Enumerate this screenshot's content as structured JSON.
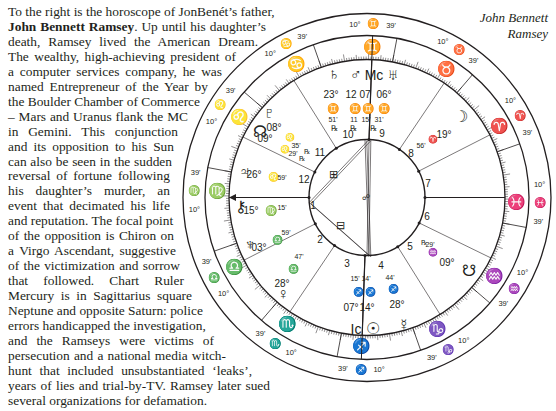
{
  "caption": {
    "line1": "John Bennett",
    "line2": "Ramsey"
  },
  "article": {
    "lines": [
      {
        "pre": "To the right is the horoscope of JonBenét’s father,",
        "bold": "",
        "post": "",
        "w": 263
      },
      {
        "pre": "",
        "bold": "John Bennett Ramsey",
        "post": ". Up until his daughter’s",
        "w": 258
      },
      {
        "pre": "death, Ramsey lived the American Dream.",
        "bold": "",
        "post": "",
        "w": 250
      },
      {
        "pre": "The wealthy, high-achieving president of",
        "bold": "",
        "post": "",
        "w": 228
      },
      {
        "pre": "a computer services company, he was",
        "bold": "",
        "post": "",
        "w": 214
      },
      {
        "pre": "named Entrepreneur of the Year by",
        "bold": "",
        "post": "",
        "w": 200
      },
      {
        "pre": "the Boulder Chamber of Commerce",
        "bold": "",
        "post": "",
        "w": 192
      },
      {
        "pre": "– Mars and Uranus flank the MC",
        "bold": "",
        "post": "",
        "w": 180
      },
      {
        "pre": "in Gemini. This conjunction",
        "bold": "",
        "post": "",
        "w": 170
      },
      {
        "pre": "and its opposition to his Sun",
        "bold": "",
        "post": "",
        "w": 166
      },
      {
        "pre": "can also be seen in the sudden",
        "bold": "",
        "post": "",
        "w": 164
      },
      {
        "pre": "reversal of fortune following",
        "bold": "",
        "post": "",
        "w": 162
      },
      {
        "pre": "his daughter’s murder, an",
        "bold": "",
        "post": "",
        "w": 162
      },
      {
        "pre": "event that decimated his life",
        "bold": "",
        "post": "",
        "w": 162
      },
      {
        "pre": "and reputation. The focal point",
        "bold": "",
        "post": "",
        "w": 164
      },
      {
        "pre": "of the opposition is Chiron on",
        "bold": "",
        "post": "",
        "w": 166
      },
      {
        "pre": "a Virgo Ascendant, suggestive",
        "bold": "",
        "post": "",
        "w": 168
      },
      {
        "pre": "of the victimization and sorrow",
        "bold": "",
        "post": "",
        "w": 172
      },
      {
        "pre": "that followed. Chart Ruler",
        "bold": "",
        "post": "",
        "w": 176
      },
      {
        "pre": "Mercury is in Sagittarius square",
        "bold": "",
        "post": "",
        "w": 184
      },
      {
        "pre": "Neptune and opposite Saturn: police",
        "bold": "",
        "post": "",
        "w": 190
      },
      {
        "pre": "errors handicapped the investigation,",
        "bold": "",
        "post": "",
        "w": 196
      },
      {
        "pre": "and the Ramseys were victims of",
        "bold": "",
        "post": "",
        "w": 206
      },
      {
        "pre": "persecution and a national media witch-",
        "bold": "",
        "post": "",
        "w": 218
      },
      {
        "pre": "hunt that included unsubstantiated ‘leaks’,",
        "bold": "",
        "post": "",
        "w": 244
      },
      {
        "pre": "years of lies and trial-by-TV. Ramsey later sued",
        "bold": "",
        "post": "",
        "w": 262
      },
      {
        "pre": "several organizations for defamation.",
        "bold": "",
        "post": "",
        "w": 0
      }
    ]
  },
  "chart": {
    "center": [
      367,
      197.5
    ],
    "radii": {
      "outer": 184,
      "sign_outer": 162,
      "sign_inner": 138,
      "house": 58
    },
    "cusp_degree": "10°",
    "cusp_minute": "39'",
    "signs_outer": [
      {
        "glyph": "♊",
        "x": 364,
        "y": 24
      },
      {
        "glyph": "♉",
        "x": 446,
        "y": 46
      },
      {
        "glyph": "♈",
        "x": 510,
        "y": 110
      },
      {
        "glyph": "♓",
        "x": 531,
        "y": 197
      },
      {
        "glyph": "♒",
        "x": 510,
        "y": 283
      },
      {
        "glyph": "♑",
        "x": 447,
        "y": 348
      },
      {
        "glyph": "♐",
        "x": 366,
        "y": 370
      },
      {
        "glyph": "♏",
        "x": 284,
        "y": 348
      },
      {
        "glyph": "♎",
        "x": 219,
        "y": 285
      },
      {
        "glyph": "♍",
        "x": 201,
        "y": 197
      },
      {
        "glyph": "♌",
        "x": 222,
        "y": 108
      },
      {
        "glyph": "♋",
        "x": 285,
        "y": 46
      }
    ],
    "signs_band": [
      {
        "glyph": "♊",
        "x": 367,
        "y": 52
      },
      {
        "glyph": "♉",
        "x": 431,
        "y": 66
      },
      {
        "glyph": "♈",
        "x": 484,
        "y": 112
      },
      {
        "glyph": "♓",
        "x": 510,
        "y": 188
      },
      {
        "glyph": "♒",
        "x": 498,
        "y": 262
      },
      {
        "glyph": "♑",
        "x": 449,
        "y": 328
      },
      {
        "glyph": "♐",
        "x": 374,
        "y": 350
      },
      {
        "glyph": "♏",
        "x": 301,
        "y": 338
      },
      {
        "glyph": "♎",
        "x": 244,
        "y": 290
      },
      {
        "glyph": "♍",
        "x": 217,
        "y": 210
      },
      {
        "glyph": "♌",
        "x": 229,
        "y": 140
      },
      {
        "glyph": "♋",
        "x": 279,
        "y": 80
      }
    ],
    "planets": [
      {
        "name": "Saturn",
        "glyph": "♄",
        "x": 334,
        "y": 75
      },
      {
        "name": "Mars",
        "glyph": "♂",
        "x": 356,
        "y": 76
      },
      {
        "name": "MC",
        "glyph": "Mc",
        "x": 374,
        "y": 76
      },
      {
        "name": "Uranus",
        "glyph": "♅",
        "x": 393,
        "y": 76
      },
      {
        "name": "Pluto",
        "glyph": "♇",
        "x": 269,
        "y": 114
      },
      {
        "name": "North Node",
        "glyph": "☊",
        "x": 260,
        "y": 133
      },
      {
        "name": "Jupiter",
        "glyph": "♃",
        "x": 245,
        "y": 173
      },
      {
        "name": "Chiron",
        "glyph": "⚷",
        "x": 241,
        "y": 208
      },
      {
        "name": "Neptune",
        "glyph": "♆",
        "x": 250,
        "y": 246
      },
      {
        "name": "Venus",
        "glyph": "♀",
        "x": 283,
        "y": 295
      },
      {
        "name": "IC",
        "glyph": "Ic",
        "x": 356,
        "y": 330
      },
      {
        "name": "Sun",
        "glyph": "☉",
        "x": 373,
        "y": 330
      },
      {
        "name": "Mercury",
        "glyph": "☿",
        "x": 404,
        "y": 326
      },
      {
        "name": "South Node",
        "glyph": "☋",
        "x": 469,
        "y": 272
      },
      {
        "name": "Moon",
        "glyph": "☽",
        "x": 461,
        "y": 118
      }
    ],
    "labels": [
      {
        "t": "23°",
        "x": 331,
        "y": 95,
        "s": 10
      },
      {
        "t": "12",
        "x": 351,
        "y": 95,
        "s": 10
      },
      {
        "t": "07",
        "x": 365,
        "y": 95,
        "s": 10
      },
      {
        "t": "06°",
        "x": 384,
        "y": 95,
        "s": 10
      },
      {
        "t": "♊",
        "x": 333,
        "y": 109,
        "s": 10
      },
      {
        "t": "♊",
        "x": 355,
        "y": 109,
        "s": 10
      },
      {
        "t": "♊",
        "x": 368,
        "y": 109,
        "s": 10
      },
      {
        "t": "♊",
        "x": 384,
        "y": 109,
        "s": 10
      },
      {
        "t": "51'",
        "x": 333,
        "y": 120,
        "s": 7
      },
      {
        "t": "11",
        "x": 354,
        "y": 120,
        "s": 7
      },
      {
        "t": "15'",
        "x": 366,
        "y": 120,
        "s": 7
      },
      {
        "t": "31'",
        "x": 379,
        "y": 120,
        "s": 7
      },
      {
        "t": "℞",
        "x": 334,
        "y": 129,
        "s": 8
      },
      {
        "t": "℞",
        "x": 353,
        "y": 129,
        "s": 8
      },
      {
        "t": "℞",
        "x": 373,
        "y": 129,
        "s": 8
      },
      {
        "t": "08°",
        "x": 274,
        "y": 128,
        "s": 10
      },
      {
        "t": "09°",
        "x": 265,
        "y": 139,
        "s": 10
      },
      {
        "t": "♌",
        "x": 290,
        "y": 138,
        "s": 8
      },
      {
        "t": "35'",
        "x": 296,
        "y": 146,
        "s": 7
      },
      {
        "t": "♌",
        "x": 285,
        "y": 150,
        "s": 8
      },
      {
        "t": "29'",
        "x": 293,
        "y": 154,
        "s": 7
      },
      {
        "t": "℞",
        "x": 307,
        "y": 152,
        "s": 7
      },
      {
        "t": "℞",
        "x": 302,
        "y": 159,
        "s": 7
      },
      {
        "t": "26°",
        "x": 254,
        "y": 175,
        "s": 10
      },
      {
        "t": "♌",
        "x": 273,
        "y": 178,
        "s": 9
      },
      {
        "t": "59'",
        "x": 282,
        "y": 178,
        "s": 7
      },
      {
        "t": "15°",
        "x": 251,
        "y": 211,
        "s": 10
      },
      {
        "t": "♍",
        "x": 271,
        "y": 211,
        "s": 10
      },
      {
        "t": "15'",
        "x": 282,
        "y": 208,
        "s": 7
      },
      {
        "t": "03°",
        "x": 259,
        "y": 248,
        "s": 10
      },
      {
        "t": "♎",
        "x": 277,
        "y": 241,
        "s": 9
      },
      {
        "t": "59'",
        "x": 286,
        "y": 233,
        "s": 7
      },
      {
        "t": "47'",
        "x": 299,
        "y": 257,
        "s": 7
      },
      {
        "t": "♎",
        "x": 293,
        "y": 270,
        "s": 9
      },
      {
        "t": "28°",
        "x": 282,
        "y": 284,
        "s": 10
      },
      {
        "t": "15'",
        "x": 355,
        "y": 279,
        "s": 7
      },
      {
        "t": "14'",
        "x": 366,
        "y": 279,
        "s": 7
      },
      {
        "t": "♐",
        "x": 358,
        "y": 293,
        "s": 9
      },
      {
        "t": "♐",
        "x": 370,
        "y": 293,
        "s": 9
      },
      {
        "t": "07°",
        "x": 351,
        "y": 308,
        "s": 10
      },
      {
        "t": "14°",
        "x": 367,
        "y": 308,
        "s": 10
      },
      {
        "t": "44'",
        "x": 390,
        "y": 278,
        "s": 7
      },
      {
        "t": "♐",
        "x": 393,
        "y": 290,
        "s": 9
      },
      {
        "t": "28°",
        "x": 397,
        "y": 305,
        "s": 10
      },
      {
        "t": "℞",
        "x": 424,
        "y": 243,
        "s": 7
      },
      {
        "t": "29'",
        "x": 430,
        "y": 245,
        "s": 7
      },
      {
        "t": "♒",
        "x": 433,
        "y": 253,
        "s": 8
      },
      {
        "t": "09°",
        "x": 447,
        "y": 263,
        "s": 10
      },
      {
        "t": "56'",
        "x": 421,
        "y": 146,
        "s": 7
      },
      {
        "t": "♈",
        "x": 433,
        "y": 140,
        "s": 8
      },
      {
        "t": "19°",
        "x": 444,
        "y": 135,
        "s": 10
      }
    ],
    "house_numbers": [
      {
        "n": "1",
        "x": 313,
        "y": 206
      },
      {
        "n": "2",
        "x": 320,
        "y": 240
      },
      {
        "n": "3",
        "x": 347,
        "y": 264
      },
      {
        "n": "4",
        "x": 381,
        "y": 266
      },
      {
        "n": "5",
        "x": 410,
        "y": 247
      },
      {
        "n": "6",
        "x": 427,
        "y": 217
      },
      {
        "n": "7",
        "x": 428,
        "y": 184
      },
      {
        "n": "8",
        "x": 411,
        "y": 154
      },
      {
        "n": "9",
        "x": 382,
        "y": 134
      },
      {
        "n": "10",
        "x": 348,
        "y": 135
      },
      {
        "n": "11",
        "x": 320,
        "y": 153
      },
      {
        "n": "12",
        "x": 304,
        "y": 180
      }
    ],
    "aspect_glyphs": [
      "⊞",
      "⊟",
      "≈"
    ]
  }
}
